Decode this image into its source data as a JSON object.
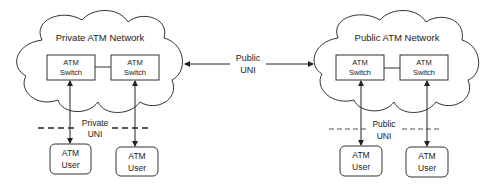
{
  "private_network": {
    "title": "Private ATM Network",
    "switches": [
      {
        "line1": "ATM",
        "line2": "Switch"
      },
      {
        "line1": "ATM",
        "line2": "Switch"
      }
    ],
    "uni_label_line1": "Private",
    "uni_label_line2": "UNI",
    "users": [
      {
        "line1": "ATM",
        "line2": "User"
      },
      {
        "line1": "ATM",
        "line2": "User"
      }
    ]
  },
  "public_uni": {
    "line1": "Public",
    "line2": "UNI"
  },
  "public_network": {
    "title": "Public ATM Network",
    "switches": [
      {
        "line1": "ATM",
        "line2": "Switch"
      },
      {
        "line1": "ATM",
        "line2": "Switch"
      }
    ],
    "uni_label_line1": "Public",
    "uni_label_line2": "UNI",
    "users": [
      {
        "line1": "ATM",
        "line2": "User"
      },
      {
        "line1": "ATM",
        "line2": "User"
      }
    ]
  }
}
